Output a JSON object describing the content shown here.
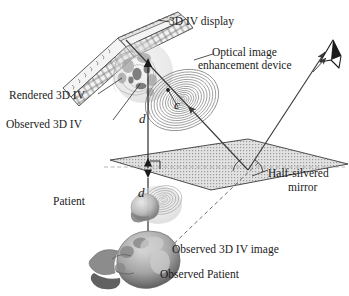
{
  "figure": {
    "title_alt": "Optical see-through 3D integral videography display with half-silvered mirror",
    "background": "#ffffff",
    "ink": "#1b1b1b"
  },
  "labels": {
    "display": "3D IV display",
    "optical_device_line1": "Optical image",
    "optical_device_line2": "enhancement device",
    "rendered_3div": "Rendered 3D IV",
    "observed_3div": "Observed 3D IV",
    "mirror_line1": "Half-silvered",
    "mirror_line2": "mirror",
    "patient": "Patient",
    "observed_3div_image": "Observed 3D IV image",
    "observed_patient": "Observed Patient",
    "dim_d_upper": "d",
    "dim_c": "c",
    "dim_d_lower": "d"
  },
  "icons": {
    "eye": "eye-viewpoint-icon",
    "lens": "fresnel-lens-icon",
    "mirror": "half-silvered-mirror-plane-icon",
    "panel": "lens-array-panel-icon",
    "skull_rendered": "rendered-skull-volume-icon",
    "skull_observed": "observed-patient-head-icon",
    "skull_patient": "patient-head-icon"
  },
  "colors": {
    "ink": "#1b1b1b",
    "line": "#2a2a2a",
    "mirror_fill": "#d8d8d8",
    "mirror_edge": "#3a3a3a",
    "panel_fill": "#efefef",
    "panel_edge": "#4a4a4a",
    "lens_ring": "#8e8e8e",
    "skull_dark": "#6e6e6e",
    "skull_light": "#cfcfcf",
    "dash": "#6b6b6b"
  },
  "geometry": {
    "mirror_quad": "110,160 248,140 348,165 212,190",
    "eye_point": "332,45",
    "lens_center": "182,100",
    "observed_point": "215,255",
    "ray_bounce": "248,170"
  }
}
